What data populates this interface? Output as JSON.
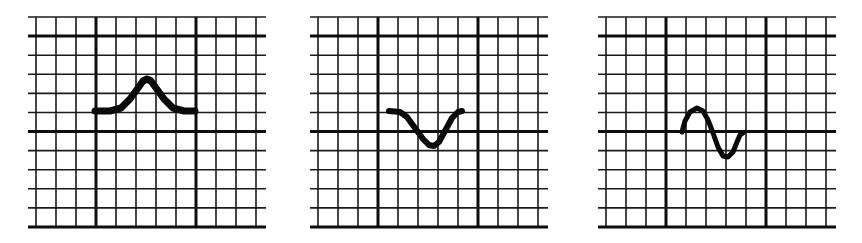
{
  "figure": {
    "colors": {
      "background": "#ffffff",
      "grid": "#1a1a1a",
      "waveform": "#0a0a0a"
    },
    "grid": {
      "columns": 12,
      "rows": 11,
      "major_line_columns": [
        3,
        8
      ],
      "major_line_rows": [
        1,
        6,
        11
      ]
    },
    "panels": [
      {
        "id": "panel-1",
        "waveform_type": "upright-deflection",
        "offset_x": 26,
        "waveform_points": "69,111 84,111 95,108 104,99 112,88 117,81 121,79 125,81 130,88 138,99 147,108 158,111 169,111",
        "stroke_width": 7
      },
      {
        "id": "panel-2",
        "waveform_type": "inverted-deflection",
        "offset_x": 308,
        "waveform_points": "81,111 92,112 99,117 107,128 115,139 121,145 126,146 131,142 137,131 144,118 150,112 154,111",
        "stroke_width": 6
      },
      {
        "id": "panel-3",
        "waveform_type": "biphasic-deflection",
        "offset_x": 596,
        "waveform_points": "86,132 89,121 94,112 101,108 107,111 112,120 117,133 122,147 127,156 132,157 137,152 141,142 144,135 147,133",
        "stroke_width": 5
      }
    ]
  }
}
